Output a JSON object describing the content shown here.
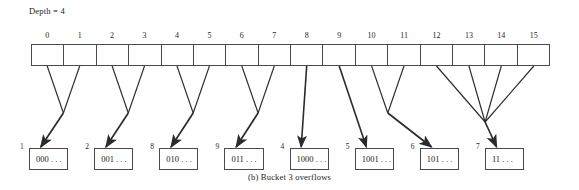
{
  "figure": {
    "caption": "(b)  Bucket 3 overflows",
    "depth_label": "Depth = 4",
    "ink_color": "#4a4a4a",
    "text_color": "#1a1a1a"
  },
  "directory": {
    "global_depth": 4,
    "cell_count": 16,
    "indices": [
      "0",
      "1",
      "2",
      "3",
      "4",
      "5",
      "6",
      "7",
      "8",
      "9",
      "10",
      "11",
      "12",
      "13",
      "14",
      "15"
    ]
  },
  "buckets": [
    {
      "depth": "1",
      "value": "000 . . ."
    },
    {
      "depth": "2",
      "value": "001 . . ."
    },
    {
      "depth": "8",
      "value": "010 . . ."
    },
    {
      "depth": "9",
      "value": "011 . . ."
    },
    {
      "depth": "4",
      "value": "1000 . . ."
    },
    {
      "depth": "5",
      "value": "1001 . . ."
    },
    {
      "depth": "6",
      "value": "101 . . ."
    },
    {
      "depth": "7",
      "value": "11 . . ."
    }
  ],
  "edges": [
    {
      "from_cells": [
        "0",
        "1"
      ],
      "to_bucket": "000 . . ."
    },
    {
      "from_cells": [
        "2",
        "3"
      ],
      "to_bucket": "001 . . ."
    },
    {
      "from_cells": [
        "4",
        "5"
      ],
      "to_bucket": "010 . . ."
    },
    {
      "from_cells": [
        "6",
        "7"
      ],
      "to_bucket": "011 . . ."
    },
    {
      "from_cells": [
        "8"
      ],
      "to_bucket": "1000 . . ."
    },
    {
      "from_cells": [
        "9"
      ],
      "to_bucket": "1001 . . ."
    },
    {
      "from_cells": [
        "10",
        "11"
      ],
      "to_bucket": "101 . . ."
    },
    {
      "from_cells": [
        "12",
        "13",
        "14",
        "15"
      ],
      "to_bucket": "11 . . ."
    }
  ]
}
